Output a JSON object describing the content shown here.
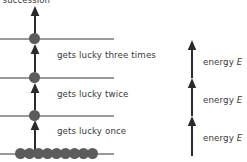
{
  "figure": {
    "caption_fragment": "in succession",
    "stroke_color": "#9a9a9a",
    "dot_color": "#5c5c5c",
    "arrow_color": "#2b2b2b",
    "text_color": "#3a3a3a",
    "background": "#ffffff"
  },
  "levels": [
    {
      "index": 3,
      "name": "level-3",
      "y": 38,
      "x": 0,
      "width": 114,
      "occupied": true
    },
    {
      "index": 2,
      "name": "level-2",
      "y": 77,
      "x": 0,
      "width": 114,
      "occupied": true
    },
    {
      "index": 1,
      "name": "level-1",
      "y": 115,
      "x": 0,
      "width": 114,
      "occupied": true
    },
    {
      "index": 0,
      "name": "ground-level",
      "y": 153,
      "x": 0,
      "width": 114,
      "occupied": true
    }
  ],
  "transitions": [
    {
      "name": "transition-three",
      "label": "gets lucky three times",
      "label_x": 57,
      "label_y": 51,
      "arrow_x": 34,
      "arrow_top": 44,
      "arrow_bottom": 72
    },
    {
      "name": "transition-twice",
      "label": "gets lucky twice",
      "label_x": 57,
      "label_y": 90,
      "arrow_x": 34,
      "arrow_top": 83,
      "arrow_bottom": 110
    },
    {
      "name": "transition-once",
      "label": "gets lucky once",
      "label_x": 57,
      "label_y": 127,
      "arrow_x": 34,
      "arrow_top": 120,
      "arrow_bottom": 148
    }
  ],
  "escape_arrow": {
    "name": "escape-arrow",
    "x": 34,
    "top": 6,
    "bottom": 34
  },
  "ground_dots": {
    "count": 9,
    "start_x": 15,
    "spacing": 10,
    "y": 148
  },
  "level_dots": [
    {
      "name": "level-3-dot",
      "x": 34,
      "y": 33
    },
    {
      "name": "level-2-dot",
      "x": 34,
      "y": 72
    },
    {
      "name": "level-1-dot",
      "x": 34,
      "y": 110
    }
  ],
  "energy_scale": {
    "arrows": [
      {
        "name": "energy-arrow-top",
        "x": 191,
        "top": 40,
        "bottom": 78
      },
      {
        "name": "energy-arrow-middle",
        "x": 191,
        "top": 78,
        "bottom": 116
      },
      {
        "name": "energy-arrow-bottom",
        "x": 191,
        "top": 116,
        "bottom": 156
      }
    ],
    "labels": [
      {
        "name": "energy-label-top",
        "text": "energy",
        "symbol": "E",
        "x": 203,
        "y": 57
      },
      {
        "name": "energy-label-middle",
        "text": "energy",
        "symbol": "E",
        "x": 203,
        "y": 95
      },
      {
        "name": "energy-label-bottom",
        "text": "energy",
        "symbol": "E",
        "x": 203,
        "y": 133
      }
    ]
  }
}
